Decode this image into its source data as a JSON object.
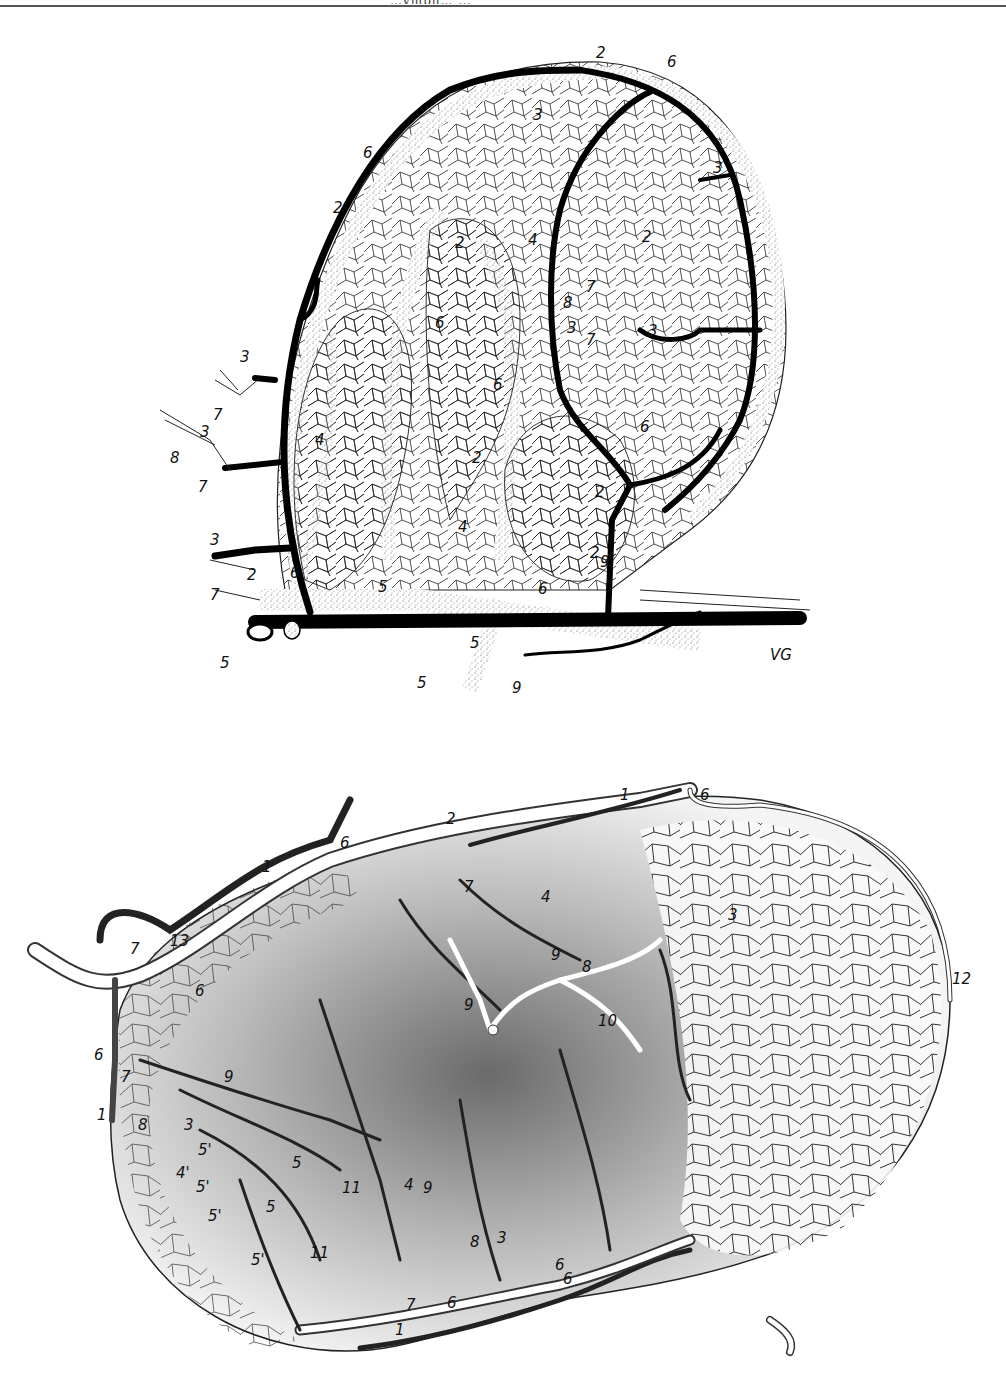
{
  "page": {
    "header_text_clipped": "…ymph… …",
    "background": "#ffffff",
    "ink_color": "#111111"
  },
  "figures": [
    {
      "id": "top",
      "style": "pen-and-ink line drawing, black vessels with stippled accompanying channels",
      "signature": "VG",
      "labels": [
        {
          "text": "2",
          "x": 452,
          "y": 58
        },
        {
          "text": "6",
          "x": 523,
          "y": 67
        },
        {
          "text": "3",
          "x": 390,
          "y": 120
        },
        {
          "text": "6",
          "x": 320,
          "y": 158
        },
        {
          "text": "3",
          "x": 570,
          "y": 168
        },
        {
          "text": "2",
          "x": 290,
          "y": 213
        },
        {
          "text": "2",
          "x": 560,
          "y": 248
        },
        {
          "text": "4",
          "x": 530,
          "y": 245
        },
        {
          "text": "2",
          "x": 642,
          "y": 242
        },
        {
          "text": "7",
          "x": 586,
          "y": 292
        },
        {
          "text": "8",
          "x": 563,
          "y": 308
        },
        {
          "text": "3",
          "x": 567,
          "y": 333
        },
        {
          "text": "7",
          "x": 586,
          "y": 345
        },
        {
          "text": "3",
          "x": 648,
          "y": 336
        },
        {
          "text": "6",
          "x": 435,
          "y": 328
        },
        {
          "text": "3",
          "x": 240,
          "y": 362
        },
        {
          "text": "6",
          "x": 493,
          "y": 390
        },
        {
          "text": "6",
          "x": 640,
          "y": 432
        },
        {
          "text": "7",
          "x": 213,
          "y": 420
        },
        {
          "text": "3",
          "x": 200,
          "y": 437
        },
        {
          "text": "4",
          "x": 315,
          "y": 445
        },
        {
          "text": "2",
          "x": 472,
          "y": 463
        },
        {
          "text": "8",
          "x": 170,
          "y": 463
        },
        {
          "text": "7",
          "x": 198,
          "y": 492
        },
        {
          "text": "2",
          "x": 595,
          "y": 497
        },
        {
          "text": "4",
          "x": 458,
          "y": 532
        },
        {
          "text": "3",
          "x": 210,
          "y": 545
        },
        {
          "text": "2",
          "x": 590,
          "y": 558
        },
        {
          "text": "2",
          "x": 247,
          "y": 580
        },
        {
          "text": "6",
          "x": 290,
          "y": 578
        },
        {
          "text": "9",
          "x": 600,
          "y": 567
        },
        {
          "text": "7",
          "x": 210,
          "y": 600
        },
        {
          "text": "5",
          "x": 378,
          "y": 592
        },
        {
          "text": "6",
          "x": 538,
          "y": 594
        },
        {
          "text": "5",
          "x": 220,
          "y": 668
        },
        {
          "text": "5",
          "x": 470,
          "y": 648
        },
        {
          "text": "5",
          "x": 417,
          "y": 688
        },
        {
          "text": "9",
          "x": 512,
          "y": 693
        }
      ]
    },
    {
      "id": "bottom",
      "style": "shaded halftone drawing, dark vessels over grey tissue with white channels",
      "labels": [
        {
          "text": "1",
          "x": 620,
          "y": 800
        },
        {
          "text": "6",
          "x": 688,
          "y": 800
        },
        {
          "text": "6",
          "x": 340,
          "y": 848
        },
        {
          "text": "1",
          "x": 264,
          "y": 872
        },
        {
          "text": "2",
          "x": 446,
          "y": 852
        },
        {
          "text": "7",
          "x": 464,
          "y": 886
        },
        {
          "text": "4",
          "x": 541,
          "y": 897
        },
        {
          "text": "3",
          "x": 728,
          "y": 914
        },
        {
          "text": "7",
          "x": 130,
          "y": 952
        },
        {
          "text": "13",
          "x": 175,
          "y": 944
        },
        {
          "text": "9",
          "x": 551,
          "y": 957
        },
        {
          "text": "8",
          "x": 582,
          "y": 969
        },
        {
          "text": "12",
          "x": 952,
          "y": 980
        },
        {
          "text": "6",
          "x": 195,
          "y": 993
        },
        {
          "text": "9",
          "x": 464,
          "y": 1007
        },
        {
          "text": "10",
          "x": 598,
          "y": 1022
        },
        {
          "text": "6",
          "x": 98,
          "y": 1057
        },
        {
          "text": "7",
          "x": 121,
          "y": 1079
        },
        {
          "text": "9",
          "x": 224,
          "y": 1079
        },
        {
          "text": "1",
          "x": 100,
          "y": 1116
        },
        {
          "text": "8",
          "x": 138,
          "y": 1127
        },
        {
          "text": "3",
          "x": 184,
          "y": 1127
        },
        {
          "text": "5'",
          "x": 200,
          "y": 1152
        },
        {
          "text": "4'",
          "x": 178,
          "y": 1175
        },
        {
          "text": "5",
          "x": 292,
          "y": 1165
        },
        {
          "text": "5'",
          "x": 198,
          "y": 1189
        },
        {
          "text": "11",
          "x": 346,
          "y": 1190
        },
        {
          "text": "4",
          "x": 404,
          "y": 1187
        },
        {
          "text": "9",
          "x": 423,
          "y": 1190
        },
        {
          "text": "5",
          "x": 266,
          "y": 1209
        },
        {
          "text": "5'",
          "x": 210,
          "y": 1218
        },
        {
          "text": "11",
          "x": 313,
          "y": 1255
        },
        {
          "text": "5'",
          "x": 253,
          "y": 1262
        },
        {
          "text": "8",
          "x": 470,
          "y": 1244
        },
        {
          "text": "3",
          "x": 497,
          "y": 1240
        },
        {
          "text": "6",
          "x": 555,
          "y": 1267
        },
        {
          "text": "6",
          "x": 563,
          "y": 1281
        },
        {
          "text": "7",
          "x": 406,
          "y": 1307
        },
        {
          "text": "6",
          "x": 447,
          "y": 1305
        },
        {
          "text": "1",
          "x": 395,
          "y": 1332
        }
      ]
    }
  ]
}
